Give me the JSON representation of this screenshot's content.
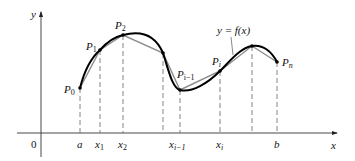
{
  "figure": {
    "colors": {
      "curve": "#000000",
      "secant": "#8c8c8c",
      "axis": "#333333",
      "dash": "#666666"
    },
    "axes": {
      "x_label": "x",
      "y_label": "y",
      "origin_label": "0"
    },
    "curve_label": "y = f(x)",
    "points": [
      {
        "name": "P",
        "sub": "0",
        "px": 80,
        "py": 88
      },
      {
        "name": "P",
        "sub": "1",
        "px": 100,
        "py": 50
      },
      {
        "name": "P",
        "sub": "2",
        "px": 123,
        "py": 35
      },
      {
        "name": "",
        "sub": "",
        "px": 163,
        "py": 53
      },
      {
        "name": "P",
        "sub": "i−1",
        "px": 180,
        "py": 90
      },
      {
        "name": "P",
        "sub": "i",
        "px": 220,
        "py": 71
      },
      {
        "name": "",
        "sub": "",
        "px": 252,
        "py": 46
      },
      {
        "name": "P",
        "sub": "n",
        "px": 277,
        "py": 62
      }
    ],
    "ticks": [
      {
        "main": "a",
        "sub": ""
      },
      {
        "main": "x",
        "sub": "1"
      },
      {
        "main": "x",
        "sub": "2"
      },
      {
        "main": "",
        "sub": ""
      },
      {
        "main": "x",
        "sub": "i−1"
      },
      {
        "main": "x",
        "sub": "i"
      },
      {
        "main": "",
        "sub": ""
      },
      {
        "main": "b",
        "sub": ""
      }
    ]
  }
}
